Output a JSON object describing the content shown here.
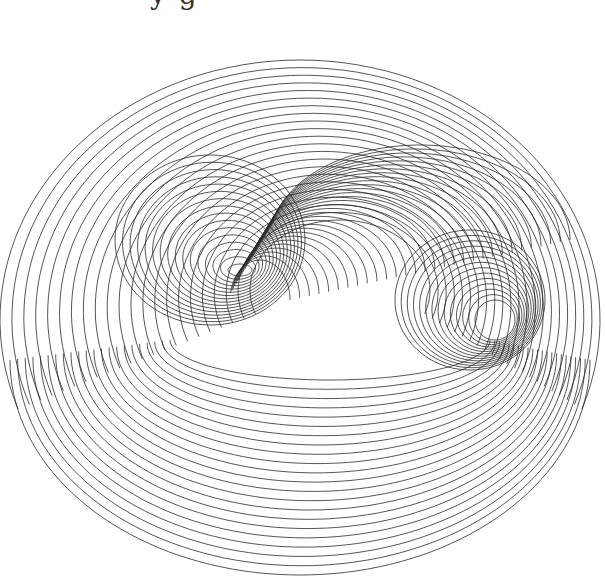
{
  "canvas": {
    "width": 605,
    "height": 577,
    "background": "#ffffff",
    "stroke": "#2a2a2a"
  },
  "title_fragment": "y   g",
  "families": [
    {
      "name": "outer-shells",
      "count": 22,
      "cx": 300,
      "cy": 320,
      "rx0": 300,
      "ry0": 260,
      "rx1": 90,
      "ry1": 70,
      "dx": 40,
      "dy": -30,
      "start": 160,
      "end": 380
    },
    {
      "name": "left-spiral",
      "count": 16,
      "cx": 210,
      "cy": 240,
      "rx0": 95,
      "ry0": 85,
      "rx1": 12,
      "ry1": 6,
      "dx": 30,
      "dy": 30,
      "start": 0,
      "end": 360
    },
    {
      "name": "right-spiral",
      "count": 14,
      "cx": 470,
      "cy": 300,
      "rx0": 75,
      "ry0": 70,
      "rx1": 20,
      "ry1": 20,
      "dx": 25,
      "dy": 20,
      "start": 0,
      "end": 360
    },
    {
      "name": "top-sheet",
      "count": 30,
      "cx": 420,
      "cy": 240,
      "rx0": 150,
      "ry0": 95,
      "rx1": 30,
      "ry1": 40,
      "dx": -160,
      "dy": 60,
      "start": 190,
      "end": 360
    },
    {
      "name": "bottom-bowl",
      "count": 22,
      "cx": 300,
      "cy": 360,
      "rx0": 290,
      "ry0": 215,
      "rx1": 160,
      "ry1": 40,
      "dx": 30,
      "dy": -20,
      "start": 0,
      "end": 180
    }
  ]
}
